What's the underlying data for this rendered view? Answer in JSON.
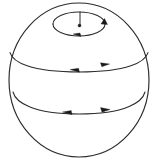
{
  "figure": {
    "title": "Sphere with latitude flow circles",
    "background_color": "#ffffff",
    "stroke_color": "#2b2b2b",
    "arrow_fill_color": "#1a1a1a"
  },
  "chart_data": {
    "type": "diagram",
    "title": "Sphere with latitude flow circles",
    "xlabel": "",
    "ylabel": "",
    "grid": false,
    "legend": false,
    "sphere": {
      "center_x": 79,
      "center_y": 80,
      "radius_x": 70,
      "radius_y": 77
    },
    "latitudes": [
      {
        "name": "polar-circle",
        "center_x": 79,
        "center_y": 24,
        "radius_x": 26,
        "radius_y": 12,
        "front_arc_visible": true,
        "back_arc_visible": true,
        "arrow_count": 2,
        "arrow_directions": [
          "right",
          "left"
        ]
      },
      {
        "name": "upper-latitude-circle",
        "center_x": 79,
        "center_y": 50,
        "radius_x": 69,
        "radius_y": 22,
        "front_arc_visible": true,
        "back_arc_visible": false,
        "arrow_count": 2,
        "arrow_directions": [
          "left",
          "right"
        ]
      },
      {
        "name": "lower-latitude-circle",
        "center_x": 79,
        "center_y": 89,
        "radius_x": 66,
        "radius_y": 25,
        "front_arc_visible": true,
        "back_arc_visible": false,
        "arrow_count": 2,
        "arrow_directions": [
          "left",
          "right"
        ]
      }
    ],
    "axis_marker": {
      "name": "polar-axis-segment",
      "x": 80,
      "y_top": 12,
      "y_bottom": 25,
      "endpoint_marker": "dot"
    },
    "arrows": [
      {
        "id": "a1",
        "on": "polar-circle",
        "x": 100,
        "y": 24,
        "direction": "right"
      },
      {
        "id": "a2",
        "on": "polar-circle",
        "x": 78,
        "y": 36,
        "direction": "left"
      },
      {
        "id": "a3",
        "on": "upper-latitude-circle",
        "x": 76,
        "y": 71,
        "direction": "left"
      },
      {
        "id": "a4",
        "on": "upper-latitude-circle",
        "x": 104,
        "y": 66,
        "direction": "right"
      },
      {
        "id": "a5",
        "on": "lower-latitude-circle",
        "x": 70,
        "y": 113,
        "direction": "left"
      },
      {
        "id": "a6",
        "on": "lower-latitude-circle",
        "x": 104,
        "y": 110,
        "direction": "right"
      }
    ]
  }
}
